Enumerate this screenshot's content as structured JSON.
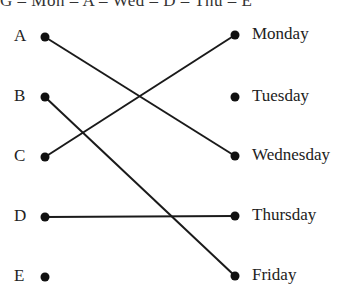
{
  "header_clipped": "G – Mon – A – Wed – D – Thu – E",
  "left_items": [
    {
      "label": "A",
      "y": 37
    },
    {
      "label": "B",
      "y": 97
    },
    {
      "label": "C",
      "y": 157
    },
    {
      "label": "D",
      "y": 217
    },
    {
      "label": "E",
      "y": 277
    }
  ],
  "right_items": [
    {
      "label": "Monday",
      "y": 35
    },
    {
      "label": "Tuesday",
      "y": 97
    },
    {
      "label": "Wednesday",
      "y": 156
    },
    {
      "label": "Thursday",
      "y": 216
    },
    {
      "label": "Friday",
      "y": 276
    }
  ],
  "connections": [
    {
      "from": "A",
      "to": "Wednesday"
    },
    {
      "from": "B",
      "to": "Friday"
    },
    {
      "from": "C",
      "to": "Monday"
    },
    {
      "from": "D",
      "to": "Thursday"
    }
  ],
  "colors": {
    "line": "#1a1a1a",
    "dot": "#111111",
    "text": "#222222"
  }
}
